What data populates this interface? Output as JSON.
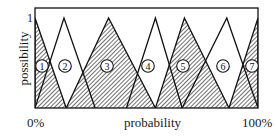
{
  "chart_data": {
    "type": "diagram",
    "title": "",
    "xlabel": "probability",
    "ylabel": "possibility",
    "x_tick_labels": [
      "0%",
      "100%"
    ],
    "y_tick_labels": [
      "1"
    ],
    "xlim": [
      0,
      100
    ],
    "ylim": [
      0,
      1
    ],
    "sets": [
      {
        "id": 1,
        "label": "1",
        "fill": "hatched",
        "left": 0,
        "peak": 0,
        "right": 14
      },
      {
        "id": 2,
        "label": "2",
        "fill": "white",
        "left": 0,
        "peak": 13,
        "right": 27
      },
      {
        "id": 3,
        "label": "3",
        "fill": "hatched",
        "left": 14,
        "peak": 33,
        "right": 54
      },
      {
        "id": 4,
        "label": "4",
        "fill": "white",
        "left": 41,
        "peak": 54,
        "right": 66
      },
      {
        "id": 5,
        "label": "5",
        "fill": "hatched",
        "left": 54,
        "peak": 67,
        "right": 87
      },
      {
        "id": 6,
        "label": "6",
        "fill": "white",
        "left": 66,
        "peak": 86,
        "right": 100
      },
      {
        "id": 7,
        "label": "7",
        "fill": "hatched",
        "left": 87,
        "peak": 100,
        "right": 100
      }
    ]
  },
  "labels": {
    "ylabel": "possibility",
    "xlabel": "probability",
    "x_min": "0%",
    "x_max": "100%",
    "y_max": "1"
  },
  "colors": {
    "stroke": "#111111",
    "hatch": "#333333",
    "background": "#ffffff"
  }
}
